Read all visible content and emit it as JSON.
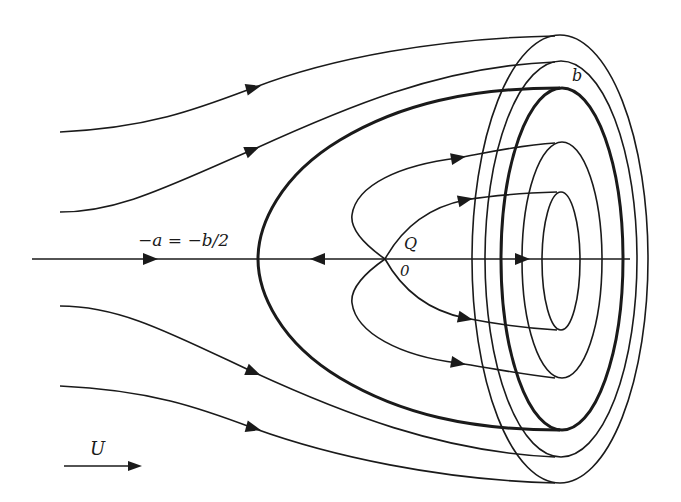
{
  "colors": {
    "stroke": "#1a1a1a",
    "background": "#ffffff"
  },
  "labels": {
    "a_eq": "−a = −b/2",
    "Q": "Q",
    "origin": "0",
    "b": "b",
    "U": "U"
  },
  "axis": {
    "x1": 32,
    "x2": 630,
    "y": 259
  },
  "stagnation_point": {
    "x": 385,
    "y": 259
  },
  "ellipses": [
    {
      "name": "inner",
      "cx": 561,
      "cy": 261,
      "rx": 19,
      "ry": 69,
      "thick": false
    },
    {
      "name": "second",
      "cx": 562,
      "cy": 260,
      "rx": 40,
      "ry": 118,
      "thick": false
    },
    {
      "name": "dividing-b",
      "cx": 562,
      "cy": 259,
      "rx": 61,
      "ry": 171,
      "thick": true
    },
    {
      "name": "fourth",
      "cx": 561,
      "cy": 259,
      "rx": 76,
      "ry": 198,
      "thick": false
    },
    {
      "name": "outer",
      "cx": 560,
      "cy": 259,
      "rx": 88,
      "ry": 224,
      "thick": false
    }
  ],
  "streamlines": [
    {
      "name": "outer-top",
      "d": "M60,132 C150,128 200,108 253,88 C330,58 440,38 555,36",
      "thick": false
    },
    {
      "name": "second-top",
      "d": "M60,212 C120,212 170,185 252,150 C340,110 440,66 555,62",
      "thick": false
    },
    {
      "name": "dividing-body",
      "d": "M560,88 C470,88 400,104 340,140 C280,176 258,225 258,259 C258,293 280,342 340,378 C400,414 470,430 560,430",
      "thick": true
    },
    {
      "name": "second-bottom",
      "d": "M60,306 C120,306 170,333 253,372 C340,412 440,452 555,457",
      "thick": false
    },
    {
      "name": "outer-bottom",
      "d": "M60,386 C150,390 200,408 253,428 C330,456 440,480 555,483",
      "thick": false
    },
    {
      "name": "inner-upper-outer",
      "d": "M385,259 C365,245 350,230 352,215 C356,185 400,165 458,158 C490,152 520,145 555,143",
      "thick": false
    },
    {
      "name": "inner-upper-inner",
      "d": "M385,259 C400,232 425,208 465,200 C495,195 525,193 557,192",
      "thick": false
    },
    {
      "name": "inner-lower-inner",
      "d": "M385,259 C400,286 425,310 465,318 C495,324 525,328 557,330",
      "thick": false
    },
    {
      "name": "inner-lower-outer",
      "d": "M385,259 C365,273 350,288 352,303 C356,333 400,356 458,363 C490,368 520,374 555,378",
      "thick": false
    }
  ],
  "arrows": [
    {
      "name": "axis-inflow",
      "x": 150,
      "y": 259,
      "angle": 0
    },
    {
      "name": "axis-reverse",
      "x": 318,
      "y": 259,
      "angle": 180
    },
    {
      "name": "axis-inner",
      "x": 522,
      "y": 259,
      "angle": 0
    },
    {
      "name": "outer-top",
      "x": 253,
      "y": 88,
      "angle": -15
    },
    {
      "name": "second-top",
      "x": 252,
      "y": 150,
      "angle": -22
    },
    {
      "name": "second-bottom",
      "x": 253,
      "y": 372,
      "angle": 22
    },
    {
      "name": "outer-bottom",
      "x": 253,
      "y": 428,
      "angle": 15
    },
    {
      "name": "inner-upper-outer",
      "x": 458,
      "y": 158,
      "angle": -10
    },
    {
      "name": "inner-upper-inner",
      "x": 465,
      "y": 200,
      "angle": -12
    },
    {
      "name": "inner-lower-inner",
      "x": 465,
      "y": 318,
      "angle": 12
    },
    {
      "name": "inner-lower-outer",
      "x": 458,
      "y": 363,
      "angle": 10
    }
  ],
  "velocity_indicator": {
    "x1": 64,
    "x2": 142,
    "y": 466
  }
}
